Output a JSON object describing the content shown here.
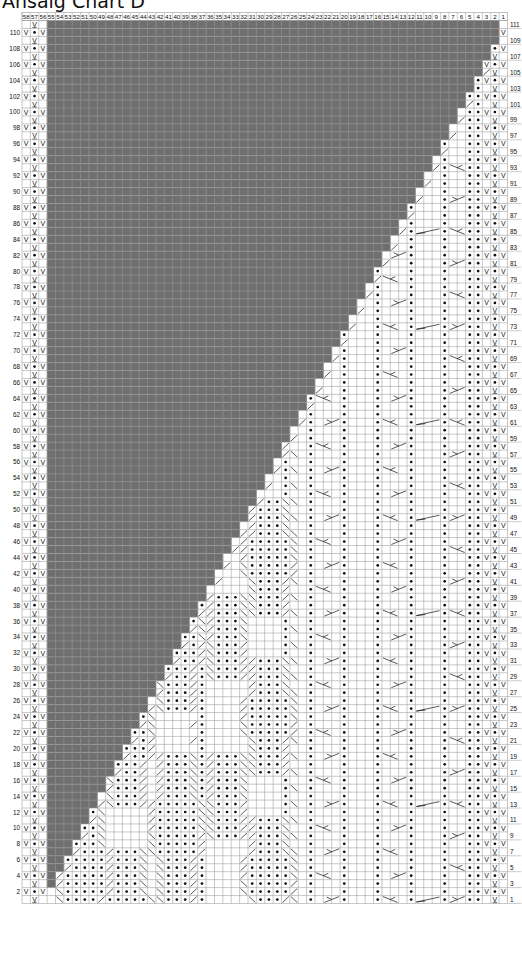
{
  "title": "Ansaig Chart D",
  "chart_data": {
    "type": "table",
    "title": "Ansaig Chart D",
    "columns": {
      "from": 58,
      "to": 1,
      "label_position": "top"
    },
    "rows": {
      "from": 1,
      "to": 111,
      "odd_labels": "right",
      "even_labels": "left"
    },
    "grid": {
      "left": 22,
      "top": 20.5,
      "cell_w": 8.37,
      "cell_h": 7.955,
      "line_color": "#9a9a9a",
      "header_height": 8
    },
    "colors": {
      "no_stitch_gray": "#6f6f6f",
      "no_stitch_grid": "#858585",
      "grid": "#9a9a9a",
      "ink": "#111111",
      "background": "#ffffff"
    },
    "no_stitch_region": {
      "description": "gray no-stitch area: upper-left triangle between col 55 and a diagonal boundary",
      "start_col": 55,
      "gray_cols_at_row": "min(54, floor((row-1)/2))"
    },
    "edge_stitches": {
      "left_even": {
        "58": "slip",
        "57": "purl",
        "56": "slip"
      },
      "left_odd": {
        "57": "slip-wyif"
      },
      "right_even": {
        "4": "purl",
        "3": "slip",
        "2": "purl",
        "1": "slip"
      },
      "right_odd": {
        "4": "purl",
        "2": "slip-wyif"
      }
    },
    "legend_symbols": {
      "knit": "blank",
      "purl": "•",
      "slip": "V",
      "slip-wyif": "V̲",
      "k2tog": "╱",
      "ssk": "╲",
      "cable-right": "⟋⟍",
      "cable-left": "⟍⟋"
    },
    "panels": [
      {
        "name": "edge-cable",
        "cols": [
          8,
          5
        ],
        "purl_cols": [
          8,
          5
        ],
        "cross_cols": [
          7,
          6
        ],
        "cross_every_rows": 4
      },
      {
        "name": "cable-panel-1",
        "cols": [
          16,
          9
        ],
        "purl_cols": [
          16,
          12
        ],
        "cross_every_rows": 6
      },
      {
        "name": "cable-panel-2",
        "cols": [
          24,
          17
        ],
        "purl_cols": [
          24,
          20
        ],
        "cross_every_rows": 6
      },
      {
        "name": "lozenge-panel-1",
        "cols": [
          36,
          25
        ],
        "purl_cols": [
          33,
          28
        ],
        "motif": "diamond"
      },
      {
        "name": "lozenge-panel-2",
        "cols": [
          54,
          37
        ],
        "purl_cols": [
          52,
          40
        ],
        "motif": "diamond"
      }
    ],
    "row_count": 111,
    "col_count": 58
  }
}
